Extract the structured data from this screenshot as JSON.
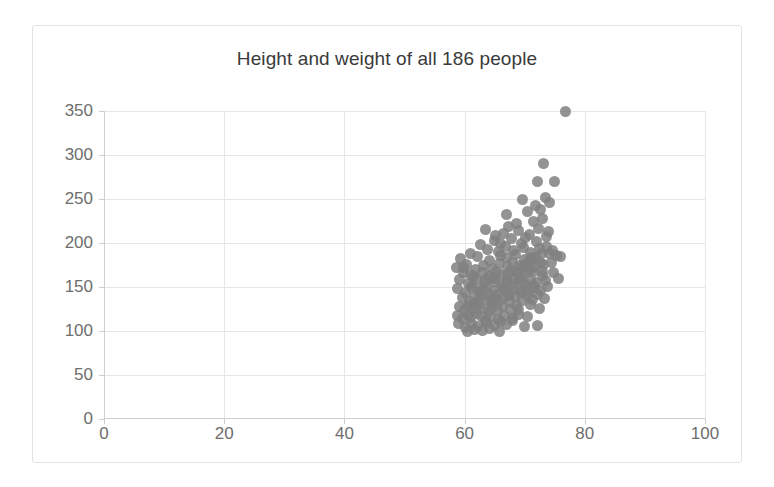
{
  "chart_data": {
    "type": "scatter",
    "title": "Height and weight of all 186 people",
    "xlabel": "",
    "ylabel": "",
    "xlim": [
      0,
      100
    ],
    "ylim": [
      0,
      350
    ],
    "xticks": [
      0,
      20,
      40,
      60,
      80,
      100
    ],
    "yticks": [
      0,
      50,
      100,
      150,
      200,
      250,
      300,
      350
    ],
    "grid": true,
    "legend": false,
    "marker_color": "#808080",
    "series": [
      {
        "name": "people",
        "n_points": 186,
        "points": [
          [
            76.8,
            350
          ],
          [
            73.2,
            290
          ],
          [
            72.1,
            270
          ],
          [
            75.0,
            270
          ],
          [
            69.6,
            249
          ],
          [
            73.4,
            252
          ],
          [
            74.2,
            246
          ],
          [
            71.8,
            243
          ],
          [
            72.6,
            238
          ],
          [
            66.9,
            232
          ],
          [
            70.4,
            236
          ],
          [
            63.4,
            215
          ],
          [
            67.3,
            219
          ],
          [
            68.6,
            222
          ],
          [
            71.4,
            225
          ],
          [
            73.0,
            228
          ],
          [
            65.1,
            208
          ],
          [
            66.4,
            211
          ],
          [
            69.0,
            214
          ],
          [
            70.8,
            210
          ],
          [
            72.3,
            217
          ],
          [
            74.0,
            213
          ],
          [
            62.7,
            198
          ],
          [
            64.9,
            203
          ],
          [
            66.0,
            200
          ],
          [
            67.8,
            205
          ],
          [
            69.4,
            199
          ],
          [
            70.2,
            206
          ],
          [
            71.9,
            202
          ],
          [
            73.6,
            207
          ],
          [
            60.9,
            188
          ],
          [
            63.8,
            193
          ],
          [
            65.6,
            190
          ],
          [
            66.8,
            196
          ],
          [
            68.1,
            191
          ],
          [
            69.8,
            195
          ],
          [
            70.9,
            189
          ],
          [
            72.4,
            194
          ],
          [
            74.6,
            192
          ],
          [
            59.4,
            182
          ],
          [
            62.2,
            185
          ],
          [
            64.1,
            180
          ],
          [
            65.9,
            186
          ],
          [
            67.0,
            183
          ],
          [
            68.4,
            187
          ],
          [
            69.9,
            181
          ],
          [
            71.2,
            184
          ],
          [
            72.8,
            188
          ],
          [
            75.3,
            186
          ],
          [
            58.6,
            172
          ],
          [
            60.3,
            176
          ],
          [
            61.8,
            170
          ],
          [
            63.1,
            175
          ],
          [
            64.6,
            171
          ],
          [
            65.8,
            177
          ],
          [
            67.2,
            173
          ],
          [
            68.0,
            178
          ],
          [
            69.1,
            174
          ],
          [
            70.6,
            179
          ],
          [
            71.7,
            172
          ],
          [
            73.1,
            176
          ],
          [
            74.4,
            178
          ],
          [
            76.0,
            185
          ],
          [
            59.9,
            166
          ],
          [
            61.4,
            162
          ],
          [
            62.9,
            167
          ],
          [
            64.2,
            163
          ],
          [
            65.3,
            168
          ],
          [
            66.2,
            164
          ],
          [
            67.6,
            169
          ],
          [
            68.8,
            165
          ],
          [
            69.5,
            161
          ],
          [
            70.3,
            166
          ],
          [
            71.5,
            168
          ],
          [
            72.9,
            163
          ],
          [
            74.8,
            167
          ],
          [
            59.1,
            158
          ],
          [
            60.7,
            154
          ],
          [
            62.0,
            159
          ],
          [
            63.3,
            155
          ],
          [
            64.4,
            160
          ],
          [
            65.0,
            156
          ],
          [
            66.1,
            152
          ],
          [
            67.1,
            157
          ],
          [
            68.3,
            153
          ],
          [
            69.2,
            158
          ],
          [
            70.0,
            154
          ],
          [
            71.0,
            159
          ],
          [
            72.0,
            155
          ],
          [
            73.5,
            157
          ],
          [
            75.6,
            160
          ],
          [
            58.9,
            148
          ],
          [
            60.1,
            144
          ],
          [
            61.2,
            149
          ],
          [
            62.5,
            145
          ],
          [
            63.6,
            150
          ],
          [
            64.8,
            146
          ],
          [
            65.5,
            141
          ],
          [
            66.6,
            147
          ],
          [
            67.4,
            143
          ],
          [
            68.2,
            148
          ],
          [
            69.3,
            144
          ],
          [
            70.1,
            149
          ],
          [
            70.7,
            145
          ],
          [
            71.6,
            150
          ],
          [
            72.7,
            146
          ],
          [
            73.8,
            151
          ],
          [
            59.6,
            138
          ],
          [
            60.8,
            134
          ],
          [
            61.6,
            139
          ],
          [
            62.3,
            135
          ],
          [
            63.0,
            140
          ],
          [
            63.9,
            136
          ],
          [
            64.5,
            132
          ],
          [
            65.2,
            137
          ],
          [
            65.7,
            133
          ],
          [
            66.5,
            138
          ],
          [
            67.5,
            134
          ],
          [
            68.5,
            139
          ],
          [
            69.7,
            135
          ],
          [
            70.5,
            140
          ],
          [
            71.3,
            136
          ],
          [
            72.2,
            141
          ],
          [
            73.3,
            137
          ],
          [
            59.2,
            128
          ],
          [
            60.0,
            124
          ],
          [
            60.6,
            129
          ],
          [
            61.5,
            125
          ],
          [
            62.4,
            130
          ],
          [
            63.2,
            126
          ],
          [
            64.0,
            122
          ],
          [
            64.7,
            127
          ],
          [
            65.4,
            123
          ],
          [
            66.3,
            128
          ],
          [
            67.7,
            124
          ],
          [
            68.7,
            129
          ],
          [
            69.0,
            125
          ],
          [
            70.9,
            130
          ],
          [
            72.5,
            126
          ],
          [
            58.8,
            118
          ],
          [
            59.7,
            114
          ],
          [
            60.4,
            119
          ],
          [
            61.0,
            115
          ],
          [
            61.9,
            120
          ],
          [
            62.8,
            116
          ],
          [
            63.5,
            112
          ],
          [
            64.3,
            117
          ],
          [
            65.6,
            113
          ],
          [
            66.7,
            118
          ],
          [
            67.9,
            114
          ],
          [
            68.9,
            119
          ],
          [
            70.4,
            116
          ],
          [
            59.0,
            108
          ],
          [
            60.2,
            104
          ],
          [
            61.1,
            109
          ],
          [
            62.1,
            105
          ],
          [
            63.7,
            110
          ],
          [
            64.9,
            106
          ],
          [
            66.0,
            111
          ],
          [
            67.0,
            107
          ],
          [
            68.0,
            112
          ],
          [
            69.9,
            105
          ],
          [
            72.1,
            106
          ],
          [
            60.5,
            100
          ],
          [
            61.7,
            102
          ],
          [
            63.0,
            101
          ],
          [
            64.2,
            103
          ],
          [
            65.8,
            100
          ],
          [
            62.6,
            144
          ],
          [
            64.1,
            142
          ],
          [
            66.9,
            156
          ],
          [
            68.6,
            168
          ],
          [
            70.2,
            176
          ],
          [
            71.8,
            184
          ],
          [
            73.7,
            196
          ],
          [
            61.3,
            152
          ],
          [
            62.9,
            148
          ],
          [
            65.1,
            160
          ],
          [
            67.2,
            164
          ],
          [
            69.6,
            172
          ],
          [
            71.1,
            180
          ],
          [
            74.1,
            188
          ],
          [
            60.9,
            164
          ],
          [
            63.4,
            158
          ],
          [
            66.4,
            150
          ],
          [
            68.1,
            160
          ],
          [
            70.8,
            170
          ],
          [
            72.6,
            178
          ],
          [
            59.8,
            172
          ],
          [
            61.6,
            130
          ],
          [
            64.6,
            134
          ],
          [
            67.3,
            140
          ],
          [
            69.4,
            146
          ],
          [
            71.4,
            152
          ],
          [
            73.0,
            168
          ]
        ]
      }
    ]
  }
}
